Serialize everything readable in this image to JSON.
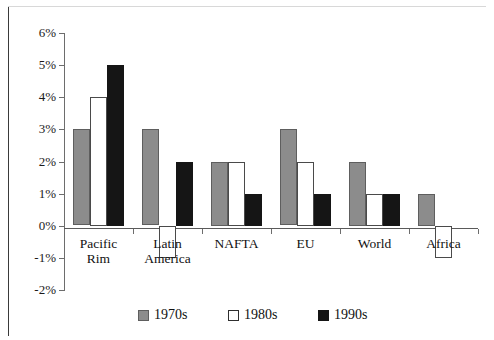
{
  "chart_data": {
    "type": "bar",
    "title": "",
    "subtitle": "",
    "xlabel": "",
    "ylabel": "",
    "categories": [
      "Pacific\nRim",
      "Latin\nAmerica",
      "NAFTA",
      "EU",
      "World",
      "Africa"
    ],
    "series": [
      {
        "name": "1970s",
        "color": "#8c8c8c",
        "values": [
          3,
          3,
          2,
          3,
          2,
          1
        ]
      },
      {
        "name": "1980s",
        "color": "#ffffff",
        "values": [
          4,
          -1,
          2,
          2,
          1,
          -1
        ]
      },
      {
        "name": "1990s",
        "color": "#151515",
        "values": [
          5,
          2,
          1,
          1,
          1,
          null
        ]
      }
    ],
    "ylim": [
      -2,
      6
    ],
    "ytick_step": 1,
    "ytick_labels": [
      "6%",
      "5%",
      "4%",
      "3%",
      "2%",
      "1%",
      "0%",
      "-1%",
      "-2%"
    ],
    "ytick_values": [
      6,
      5,
      4,
      3,
      2,
      1,
      0,
      -1,
      -2
    ],
    "value_suffix": "%",
    "grid": false,
    "legend_position": "bottom"
  },
  "legend": {
    "items": [
      {
        "label": "1970s",
        "swatch": "gray-swatch"
      },
      {
        "label": "1980s",
        "swatch": "white-swatch"
      },
      {
        "label": "1990s",
        "swatch": "black-swatch"
      }
    ]
  },
  "colors": {
    "series_1970s": "#8c8c8c",
    "series_1980s": "#ffffff",
    "series_1990s": "#151515",
    "axis": "#5a5a5a",
    "text": "#111111",
    "frame": "#3a3a3a"
  }
}
